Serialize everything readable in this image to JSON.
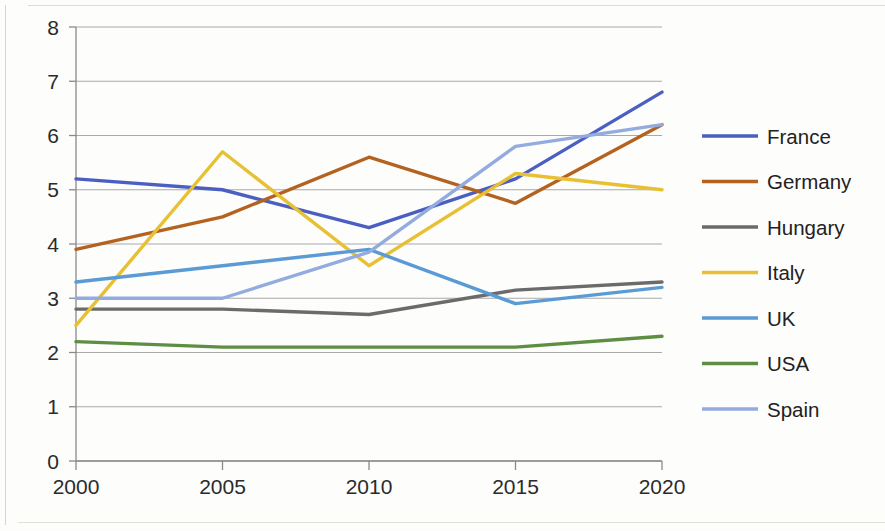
{
  "chart_data": {
    "type": "line",
    "title": "",
    "subtitle": "",
    "xlabel": "",
    "ylabel": "",
    "x": [
      2000,
      2005,
      2010,
      2015,
      2020
    ],
    "categories": [
      "2000",
      "2005",
      "2010",
      "2015",
      "2020"
    ],
    "xtick_labels": [
      "2000",
      "2005",
      "2010",
      "2015",
      "2020"
    ],
    "ytick_labels": [
      "0",
      "1",
      "2",
      "3",
      "4",
      "5",
      "6",
      "7",
      "8"
    ],
    "yticks": [
      0,
      1,
      2,
      3,
      4,
      5,
      6,
      7,
      8
    ],
    "ylim": [
      0,
      8
    ],
    "xlim": [
      2000,
      2020
    ],
    "grid": true,
    "grid_axis": "y",
    "legend_position": "right",
    "series": [
      {
        "name": "France",
        "values": [
          5.2,
          5.0,
          4.3,
          5.2,
          6.8
        ],
        "color": "#4A5FC1"
      },
      {
        "name": "Germany",
        "values": [
          3.9,
          4.5,
          5.6,
          4.75,
          6.2
        ],
        "color": "#B4621F"
      },
      {
        "name": "Hungary",
        "values": [
          2.8,
          2.8,
          2.7,
          3.15,
          3.3
        ],
        "color": "#6B6B6B"
      },
      {
        "name": "Italy",
        "values": [
          2.5,
          5.7,
          3.6,
          5.3,
          5.0
        ],
        "color": "#E8C033"
      },
      {
        "name": "UK",
        "values": [
          3.3,
          3.6,
          3.9,
          2.9,
          3.2
        ],
        "color": "#5B9BD5"
      },
      {
        "name": "USA",
        "values": [
          2.2,
          2.1,
          2.1,
          2.1,
          2.3
        ],
        "color": "#5E8E42"
      },
      {
        "name": "Spain",
        "values": [
          3.0,
          3.0,
          3.85,
          5.8,
          6.2
        ],
        "color": "#93ABDE"
      }
    ]
  },
  "legend": {
    "items": [
      {
        "label": "France"
      },
      {
        "label": "Germany"
      },
      {
        "label": "Hungary"
      },
      {
        "label": "Italy"
      },
      {
        "label": "UK"
      },
      {
        "label": "USA"
      },
      {
        "label": "Spain"
      }
    ]
  },
  "colors": {
    "grid": "#a9a9a9",
    "axis": "#8a8a8a",
    "background": "#fdfdfc",
    "text": "#2b2b2b"
  }
}
